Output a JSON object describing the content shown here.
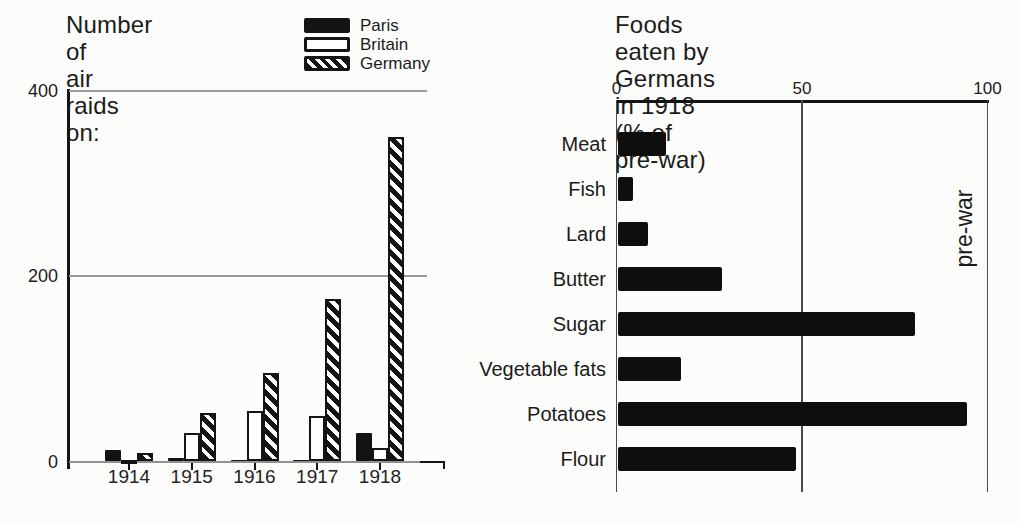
{
  "left_chart": {
    "title_lines": [
      "Number of",
      "air raids on:"
    ]
  },
  "right_chart": {
    "title_lines": [
      "Foods eaten by Germans in 1918",
      "(% of pre-war)"
    ],
    "annotation": "pre-war"
  },
  "colors": {
    "ink": "#141414",
    "grid_gray": "#9a9a9a",
    "rule_gray": "#4a4a4a",
    "paper": "#fcfcfa"
  },
  "chart_data": [
    {
      "id": "air-raids",
      "type": "bar",
      "title": "Number of air raids on:",
      "categories": [
        "1914",
        "1915",
        "1916",
        "1917",
        "1918"
      ],
      "series": [
        {
          "name": "Paris",
          "style": "solid-black",
          "values": [
            12,
            4,
            2,
            2,
            31
          ]
        },
        {
          "name": "Britain",
          "style": "white-outline",
          "values": [
            2,
            31,
            55,
            49,
            15
          ]
        },
        {
          "name": "Germany",
          "style": "diagonal-hatch",
          "values": [
            9,
            52,
            96,
            175,
            350
          ]
        }
      ],
      "ylabel": "",
      "yticks": [
        0,
        200,
        400
      ],
      "ylim": [
        0,
        400
      ],
      "grid": "horizontal-gray",
      "legend_position": "top-right"
    },
    {
      "id": "german-foods-1918",
      "type": "bar-horizontal",
      "title": "Foods eaten by Germans in 1918",
      "subtitle": "(% of pre-war)",
      "categories": [
        "Meat",
        "Fish",
        "Lard",
        "Butter",
        "Sugar",
        "Vegetable fats",
        "Potatoes",
        "Flour"
      ],
      "values": [
        13,
        4,
        8,
        28,
        80,
        17,
        94,
        48
      ],
      "xlabel": "",
      "xticks": [
        0,
        50,
        100
      ],
      "xlim": [
        0,
        100
      ],
      "annotation": "pre-war",
      "annotation_note": "vertical label beside the 100% line",
      "grid": "vertical-lines-at-ticks"
    }
  ]
}
